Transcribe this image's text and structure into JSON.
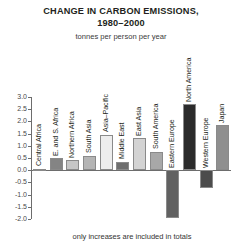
{
  "header": {
    "title_line1": "CHANGE IN CARBON EMISSIONS,",
    "title_line2": "1980–2000",
    "subtitle": "tonnes per person per year"
  },
  "footnote": {
    "text": "only increases are included in totals"
  },
  "chart_data": {
    "type": "bar",
    "title": "CHANGE IN CARBON EMISSIONS, 1980–2000",
    "subtitle": "tonnes per person per year",
    "xlabel": "",
    "ylabel": "tonnes per person per year",
    "ylim": [
      -2.0,
      3.0
    ],
    "ytick_step": 0.5,
    "yticks": [
      "3.0",
      "2.5",
      "2.0",
      "1.5",
      "1.0",
      "0.5",
      "0.0",
      "-0.5",
      "-1.0",
      "-1.5",
      "-2.0"
    ],
    "grid": false,
    "legend": "none",
    "annotation": "only increases are included in totals",
    "categories": [
      "Central Africa",
      "E. and S. Africa",
      "Northern Africa",
      "South Asia",
      "Asia–Pacific",
      "Middle East",
      "East Asia",
      "South America",
      "Eastern Europe",
      "North America",
      "Western Europe",
      "Japan"
    ],
    "values": [
      0.05,
      0.5,
      0.4,
      0.6,
      1.45,
      0.35,
      1.3,
      0.75,
      -1.95,
      2.7,
      -0.75,
      1.85
    ],
    "colors": [
      "#b8b8b8",
      "#848484",
      "#c6c6c6",
      "#b4b4b4",
      "#ededed",
      "#6e6e6e",
      "#d3d3d3",
      "#a8a8a8",
      "#616161",
      "#2b2b2b",
      "#4c4c4c",
      "#8f8f8f"
    ]
  }
}
